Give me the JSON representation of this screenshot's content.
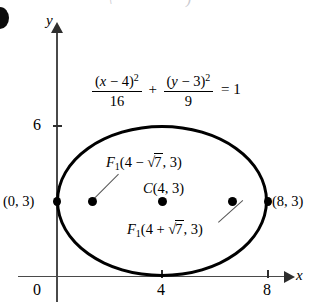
{
  "figure": {
    "type": "ellipse-diagram",
    "equation": {
      "left_num": "(x − 4)²",
      "left_den": "16",
      "plus": "+",
      "right_num": "(y − 3)²",
      "right_den": "9",
      "equals": "= 1",
      "full": "(x − 4)²/16 + (y − 3)²/9 = 1"
    },
    "axes": {
      "x_label": "x",
      "y_label": "y",
      "x_ticks": [
        "0",
        "4",
        "8"
      ],
      "y_ticks": [
        "6"
      ],
      "origin_label": "0"
    },
    "labels": {
      "center": "C(4, 3)",
      "focus_left": "F₁(4 − √7, 3)",
      "focus_right": "F₁(4 + √7, 3)",
      "vertex_left": "(0, 3)",
      "vertex_right": "(8, 3)"
    },
    "points": [
      {
        "name": "vertex-left",
        "label": "(0, 3)",
        "x": 0,
        "y": 3
      },
      {
        "name": "focus-left",
        "label": "F₁(4 − √7, 3)",
        "x": 1.354,
        "y": 3
      },
      {
        "name": "center",
        "label": "C(4, 3)",
        "x": 4,
        "y": 3
      },
      {
        "name": "focus-right",
        "label": "F₁(4 + √7, 3)",
        "x": 6.646,
        "y": 3
      },
      {
        "name": "vertex-right",
        "label": "(8, 3)",
        "x": 8,
        "y": 3
      }
    ],
    "colors": {
      "curve": "#000000",
      "axis": "#4a4a4a",
      "text": "#000000"
    },
    "top_fragment_left": "\\",
    "top_fragment_right": ")"
  }
}
